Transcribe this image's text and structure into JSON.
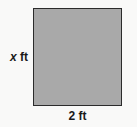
{
  "figure": {
    "kind": "square-diagram",
    "background_color": "#f9f9f8",
    "shape": {
      "name": "square",
      "fill_color": "#a9a9a9",
      "stroke_color": "#2b2b2b"
    },
    "labels": {
      "height": {
        "variable": "x",
        "unit": "ft",
        "full_text": "x ft",
        "position": "left"
      },
      "width": {
        "value": "2",
        "unit": "ft",
        "full_text": "2 ft",
        "position": "bottom"
      }
    }
  }
}
